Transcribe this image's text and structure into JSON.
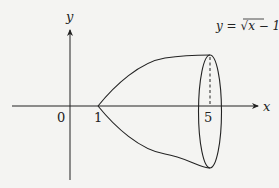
{
  "diagram": {
    "equation_label": "y = √x − 1",
    "equation_parts": {
      "lhs": "y",
      "eq": " = ",
      "radical": "√",
      "radicand": "x − 1"
    },
    "axis_labels": {
      "x": "x",
      "y": "y"
    },
    "tick_labels": {
      "origin": "0",
      "one": "1",
      "five": "5"
    },
    "colors": {
      "stroke": "#222222",
      "background": "#f4f4f2"
    }
  }
}
